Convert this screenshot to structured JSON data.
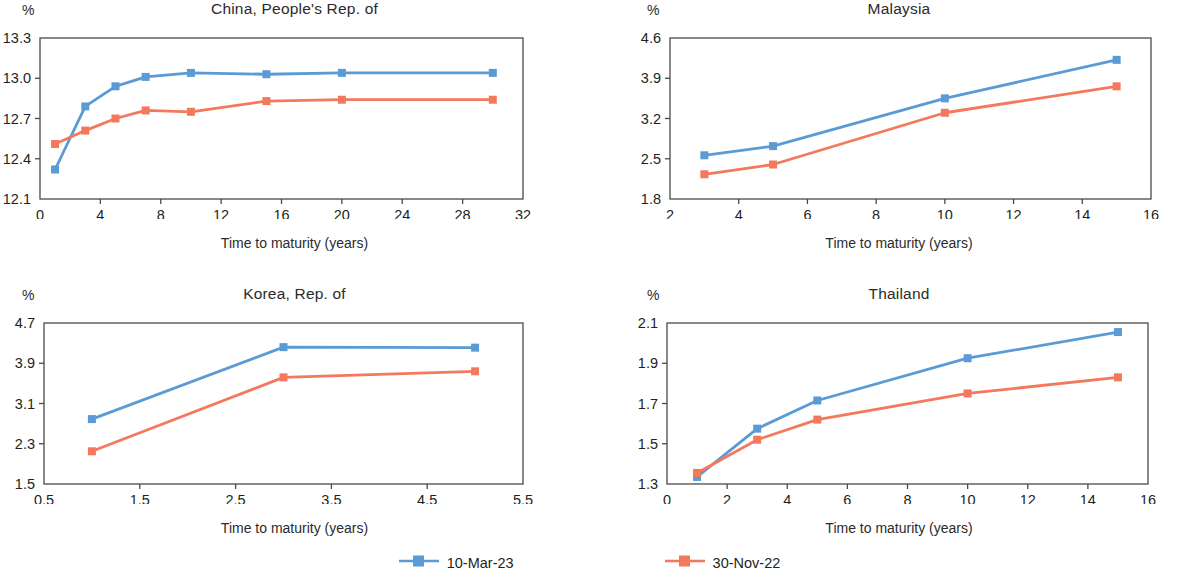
{
  "figure": {
    "x_axis_label": "Time to maturity (years)",
    "y_axis_label": "%",
    "colors": {
      "series_1": "#5B9BD5",
      "series_2": "#F4785C",
      "axis": "#4a4a4a",
      "text": "#231f20"
    }
  },
  "legend": {
    "items": [
      {
        "label": "10-Mar-23",
        "color": "#5B9BD5"
      },
      {
        "label": "30-Nov-22",
        "color": "#F4785C"
      }
    ]
  },
  "chart_data": [
    {
      "type": "line",
      "title": "China, People's Rep. of",
      "xlabel": "Time to maturity (years)",
      "ylabel": "%",
      "xlim": [
        0,
        32
      ],
      "ylim": [
        12.1,
        13.3
      ],
      "xticks": [
        0,
        4,
        8,
        12,
        16,
        20,
        24,
        28,
        32
      ],
      "yticks": [
        12.1,
        12.4,
        12.7,
        13.0,
        13.3
      ],
      "ytick_labels": [
        "12.1",
        "12.4",
        "12.7",
        "13.0",
        "13.3"
      ],
      "grid": false,
      "legend_position": "bottom",
      "series": [
        {
          "name": "10-Mar-23",
          "color": "#5B9BD5",
          "x": [
            1,
            3,
            5,
            7,
            10,
            15,
            20,
            30
          ],
          "values": [
            12.32,
            12.79,
            12.94,
            13.01,
            13.04,
            13.03,
            13.04,
            13.04
          ]
        },
        {
          "name": "30-Nov-22",
          "color": "#F4785C",
          "x": [
            1,
            3,
            5,
            7,
            10,
            15,
            20,
            30
          ],
          "values": [
            12.51,
            12.61,
            12.7,
            12.76,
            12.75,
            12.83,
            12.84,
            12.84
          ]
        }
      ]
    },
    {
      "type": "line",
      "title": "Malaysia",
      "xlabel": "Time to maturity (years)",
      "ylabel": "%",
      "xlim": [
        2,
        16
      ],
      "ylim": [
        1.8,
        4.6
      ],
      "xticks": [
        2,
        4,
        6,
        8,
        10,
        12,
        14,
        16
      ],
      "yticks": [
        1.8,
        2.5,
        3.2,
        3.9,
        4.6
      ],
      "ytick_labels": [
        "1.8",
        "2.5",
        "3.2",
        "3.9",
        "4.6"
      ],
      "grid": false,
      "legend_position": "bottom",
      "series": [
        {
          "name": "10-Mar-23",
          "color": "#5B9BD5",
          "x": [
            3,
            5,
            10,
            15
          ],
          "values": [
            2.56,
            2.72,
            3.55,
            4.22
          ]
        },
        {
          "name": "30-Nov-22",
          "color": "#F4785C",
          "x": [
            3,
            5,
            10,
            15
          ],
          "values": [
            2.23,
            2.4,
            3.3,
            3.76
          ]
        }
      ]
    },
    {
      "type": "line",
      "title": "Korea, Rep. of",
      "xlabel": "Time to maturity (years)",
      "ylabel": "%",
      "xlim": [
        0.5,
        5.5
      ],
      "ylim": [
        1.5,
        4.7
      ],
      "xticks": [
        0.5,
        1.5,
        2.5,
        3.5,
        4.5,
        5.5
      ],
      "xtick_labels": [
        "0.5",
        "1.5",
        "2.5",
        "3.5",
        "4.5",
        "5.5"
      ],
      "yticks": [
        1.5,
        2.3,
        3.1,
        3.9,
        4.7
      ],
      "ytick_labels": [
        "1.5",
        "2.3",
        "3.1",
        "3.9",
        "4.7"
      ],
      "grid": false,
      "legend_position": "bottom",
      "series": [
        {
          "name": "10-Mar-23",
          "color": "#5B9BD5",
          "x": [
            1,
            3,
            5
          ],
          "values": [
            2.79,
            4.22,
            4.21
          ]
        },
        {
          "name": "30-Nov-22",
          "color": "#F4785C",
          "x": [
            1,
            3,
            5
          ],
          "values": [
            2.15,
            3.62,
            3.74
          ]
        }
      ]
    },
    {
      "type": "line",
      "title": "Thailand",
      "xlabel": "Time to maturity (years)",
      "ylabel": "%",
      "xlim": [
        0,
        16
      ],
      "ylim": [
        1.3,
        2.1
      ],
      "xticks": [
        0,
        2,
        4,
        6,
        8,
        10,
        12,
        14,
        16
      ],
      "yticks": [
        1.3,
        1.5,
        1.7,
        1.9,
        2.1
      ],
      "ytick_labels": [
        "1.3",
        "1.5",
        "1.7",
        "1.9",
        "2.1"
      ],
      "grid": false,
      "legend_position": "bottom",
      "series": [
        {
          "name": "10-Mar-23",
          "color": "#5B9BD5",
          "x": [
            1,
            3,
            5,
            10,
            15
          ],
          "values": [
            1.335,
            1.575,
            1.715,
            1.925,
            2.055
          ]
        },
        {
          "name": "30-Nov-22",
          "color": "#F4785C",
          "x": [
            1,
            3,
            5,
            10,
            15
          ],
          "values": [
            1.355,
            1.52,
            1.62,
            1.75,
            1.83
          ]
        }
      ]
    }
  ]
}
